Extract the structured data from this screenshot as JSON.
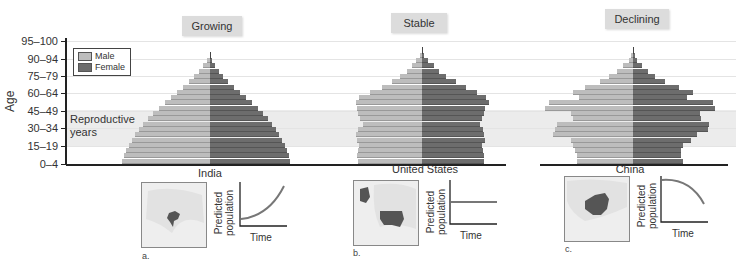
{
  "chart_data": {
    "type": "bar",
    "subtype": "population-pyramid",
    "ylabel": "Age",
    "y_ticks": [
      "0–4",
      "15–19",
      "30–34",
      "45–49",
      "60–64",
      "75–79",
      "90–94",
      "95–100"
    ],
    "legend": [
      {
        "name": "Male",
        "color": "#bdbdbd"
      },
      {
        "name": "Female",
        "color": "#6d6d6d"
      }
    ],
    "annotation": "Reproductive years",
    "reproductive_band": [
      "15–19",
      "45–49"
    ],
    "pyramids": [
      {
        "title": "Growing",
        "country": "India",
        "panel": "a.",
        "trend": "exponential-increase",
        "male_widths": [
          88,
          86,
          84,
          81,
          78,
          75,
          71,
          67,
          62,
          57,
          51,
          45,
          39,
          33,
          27,
          21,
          16,
          11,
          7,
          3
        ],
        "female_widths": [
          80,
          79,
          77,
          75,
          72,
          69,
          66,
          62,
          58,
          53,
          48,
          42,
          36,
          30,
          24,
          18,
          13,
          9,
          5,
          2
        ]
      },
      {
        "title": "Stable",
        "country": "United States",
        "panel": "b.",
        "trend": "flat",
        "male_widths": [
          64,
          65,
          64,
          63,
          65,
          66,
          64,
          59,
          62,
          64,
          65,
          66,
          63,
          52,
          40,
          30,
          22,
          15,
          10,
          6,
          2
        ],
        "female_widths": [
          62,
          62,
          61,
          60,
          63,
          62,
          61,
          58,
          60,
          62,
          63,
          67,
          64,
          55,
          44,
          34,
          24,
          17,
          12,
          6,
          2
        ]
      },
      {
        "title": "Declining",
        "country": "China",
        "panel": "c.",
        "trend": "decrease",
        "male_widths": [
          56,
          56,
          58,
          60,
          62,
          80,
          78,
          76,
          60,
          62,
          88,
          84,
          54,
          60,
          48,
          33,
          24,
          16,
          10,
          4,
          2
        ],
        "female_widths": [
          50,
          48,
          48,
          50,
          58,
          64,
          75,
          76,
          68,
          67,
          82,
          80,
          54,
          60,
          46,
          32,
          22,
          15,
          9,
          4,
          2
        ]
      }
    ],
    "growth_curves": {
      "ylabel": "Predicted population",
      "xlabel": "Time"
    }
  },
  "axis": {
    "ylabel": "Age",
    "ticks": [
      {
        "label": "95–100",
        "y": 41
      },
      {
        "label": "90–94",
        "y": 59
      },
      {
        "label": "75–79",
        "y": 76
      },
      {
        "label": "60–64",
        "y": 93
      },
      {
        "label": "45–49",
        "y": 111
      },
      {
        "label": "30–34",
        "y": 128
      },
      {
        "label": "15–19",
        "y": 146
      },
      {
        "label": "0–4",
        "y": 164
      }
    ]
  },
  "legend": {
    "male": "Male",
    "female": "Female"
  },
  "annotation": {
    "line1": "Reproductive",
    "line2": "years"
  },
  "panels": [
    {
      "title": "Growing",
      "country": "India",
      "letter": "a.",
      "ylabel1": "Predicted",
      "ylabel2": "population",
      "xlabel": "Time"
    },
    {
      "title": "Stable",
      "country": "United States",
      "letter": "b.",
      "ylabel1": "Predicted",
      "ylabel2": "population",
      "xlabel": "Time"
    },
    {
      "title": "Declining",
      "country": "China",
      "letter": "c.",
      "ylabel1": "Predicted",
      "ylabel2": "population",
      "xlabel": "Time"
    }
  ]
}
